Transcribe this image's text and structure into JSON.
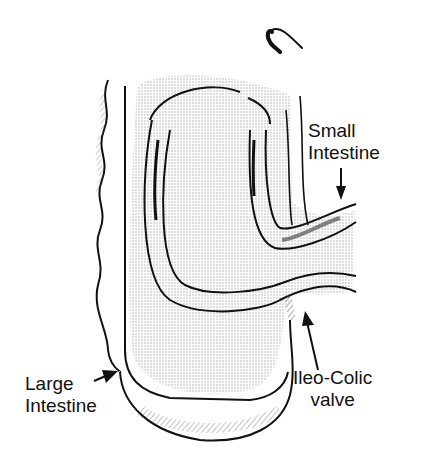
{
  "diagram": {
    "labels": {
      "small_intestine_line1": "Small",
      "small_intestine_line2": "Intestine",
      "large_intestine_line1": "Large",
      "large_intestine_line2": "Intestine",
      "valve_line1": "Ileo-Colic",
      "valve_line2": "valve"
    },
    "colors": {
      "ink": "#111111",
      "shading": "#cfcfcf",
      "background": "#ffffff"
    }
  }
}
